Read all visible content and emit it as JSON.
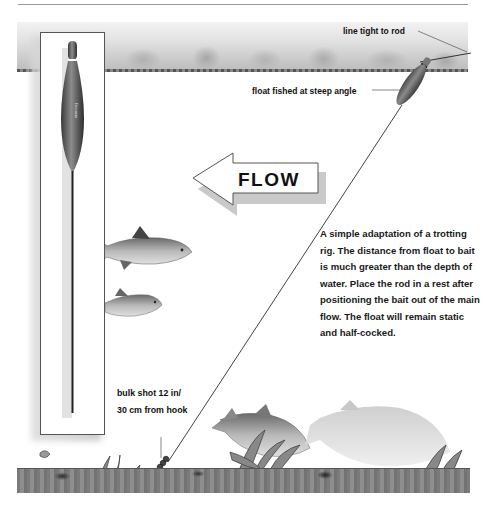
{
  "diagram": {
    "title_graphic": "Half-cocked trotting float rig",
    "labels": {
      "line_tight": "line tight to rod",
      "float_angle": "float fished at steep angle",
      "flow": "FLOW",
      "bulk_shot_line1": "bulk shot 12 in/",
      "bulk_shot_line2": "30 cm from hook"
    },
    "description": "A simple adaptation of a trotting rig. The distance from float to bait is much greater than the depth of water. Place the rod in a rest after positioning the bait out of the main flow. The float will remain static and half-cocked.",
    "elements": [
      "inset-float-closeup",
      "surface-float",
      "fishing-line",
      "bulk-shot",
      "hook-bait",
      "fish",
      "weed",
      "river-bed",
      "flow-arrow"
    ],
    "colors": {
      "float_body": "#6e6e6e",
      "float_tip": "#8a8a8a",
      "text": "#111111",
      "line": "#333333"
    }
  }
}
